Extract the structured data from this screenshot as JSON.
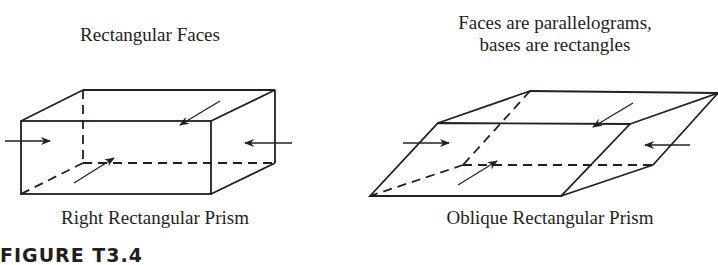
{
  "left_figure": {
    "title": "Rectangular Faces",
    "caption": "Right Rectangular Prism"
  },
  "right_figure": {
    "title_line1": "Faces are parallelograms,",
    "title_line2": "bases are rectangles",
    "caption": "Oblique Rectangular Prism"
  },
  "figure_label": "FIGURE T3.4",
  "colors": {
    "stroke": "#231f20",
    "background": "#ffffff"
  }
}
